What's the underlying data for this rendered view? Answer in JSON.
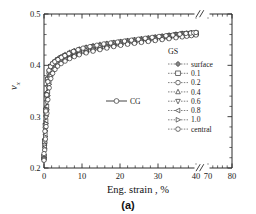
{
  "figure": {
    "caption": "(a)"
  },
  "chart_data": {
    "type": "line",
    "title": "",
    "xlabel": "Eng. strain , %",
    "ylabel": "ν",
    "ylabel_subscript": "x",
    "xlim": [
      0,
      80
    ],
    "ylim": [
      0.2,
      0.5
    ],
    "xticks": [
      0,
      10,
      20,
      30,
      40,
      70,
      80
    ],
    "xticklabels": [
      "0",
      "10",
      "20",
      "30",
      "40",
      "70",
      "80"
    ],
    "yticks": [
      0.2,
      0.3,
      0.4,
      0.5
    ],
    "yticklabels": [
      "0.2",
      "0.3",
      "0.4",
      "0.5"
    ],
    "axis_break": {
      "present": true,
      "between": [
        40,
        70
      ],
      "symbol": "//"
    },
    "grid": false,
    "legend_position": "right-inside",
    "legend_title": "GS",
    "series": [
      {
        "name": "surface",
        "marker": "star",
        "linestyle": "dotted",
        "x": [
          0,
          0.3,
          0.6,
          1.0,
          1.6,
          2.4,
          3.5,
          5,
          7,
          9,
          12,
          15,
          18,
          21,
          24,
          27,
          30,
          33,
          36,
          38,
          40
        ],
        "y": [
          0.225,
          0.275,
          0.325,
          0.375,
          0.398,
          0.405,
          0.412,
          0.419,
          0.426,
          0.431,
          0.437,
          0.441,
          0.444,
          0.447,
          0.45,
          0.453,
          0.456,
          0.459,
          0.462,
          0.463,
          0.464
        ]
      },
      {
        "name": "0.1",
        "marker": "square",
        "linestyle": "dotted",
        "x": [
          0,
          0.3,
          0.6,
          1.0,
          1.6,
          2.4,
          3.5,
          5,
          7,
          9,
          12,
          15,
          18,
          21,
          24,
          27,
          30,
          33,
          36,
          38,
          40
        ],
        "y": [
          0.222,
          0.272,
          0.322,
          0.372,
          0.396,
          0.403,
          0.41,
          0.417,
          0.424,
          0.429,
          0.435,
          0.439,
          0.443,
          0.446,
          0.449,
          0.452,
          0.455,
          0.458,
          0.461,
          0.462,
          0.463
        ]
      },
      {
        "name": "0.2",
        "marker": "circle",
        "linestyle": "dotted",
        "x": [
          0,
          0.3,
          0.6,
          1.0,
          1.6,
          2.4,
          3.5,
          5,
          7,
          9,
          12,
          15,
          18,
          21,
          24,
          27,
          30,
          33,
          36,
          38,
          40
        ],
        "y": [
          0.22,
          0.268,
          0.318,
          0.368,
          0.393,
          0.401,
          0.408,
          0.415,
          0.422,
          0.427,
          0.433,
          0.438,
          0.442,
          0.445,
          0.448,
          0.451,
          0.454,
          0.457,
          0.46,
          0.461,
          0.462
        ]
      },
      {
        "name": "0.4",
        "marker": "triangle-up",
        "linestyle": "dotted",
        "x": [
          0,
          0.3,
          0.6,
          1.0,
          1.6,
          2.4,
          3.5,
          5,
          7,
          9,
          12,
          15,
          18,
          21,
          24,
          27,
          30,
          33,
          36,
          38,
          40
        ],
        "y": [
          0.219,
          0.264,
          0.313,
          0.362,
          0.39,
          0.399,
          0.406,
          0.413,
          0.42,
          0.425,
          0.431,
          0.436,
          0.44,
          0.444,
          0.447,
          0.45,
          0.453,
          0.456,
          0.459,
          0.46,
          0.462
        ]
      },
      {
        "name": "0.6",
        "marker": "triangle-down",
        "linestyle": "dotted",
        "x": [
          0,
          0.3,
          0.6,
          1.0,
          1.6,
          2.4,
          3.5,
          5,
          7,
          9,
          12,
          15,
          18,
          21,
          24,
          27,
          30,
          33,
          36,
          38,
          40
        ],
        "y": [
          0.218,
          0.26,
          0.307,
          0.356,
          0.386,
          0.396,
          0.404,
          0.411,
          0.418,
          0.424,
          0.43,
          0.435,
          0.439,
          0.443,
          0.446,
          0.449,
          0.452,
          0.455,
          0.458,
          0.46,
          0.461
        ]
      },
      {
        "name": "0.8",
        "marker": "triangle-left",
        "linestyle": "dotted",
        "x": [
          0,
          0.3,
          0.6,
          1.0,
          1.6,
          2.4,
          3.5,
          5,
          7,
          9,
          12,
          15,
          18,
          21,
          24,
          27,
          30,
          33,
          36,
          38,
          40
        ],
        "y": [
          0.217,
          0.256,
          0.3,
          0.348,
          0.381,
          0.393,
          0.402,
          0.409,
          0.417,
          0.422,
          0.428,
          0.433,
          0.438,
          0.442,
          0.445,
          0.448,
          0.451,
          0.454,
          0.457,
          0.459,
          0.46
        ]
      },
      {
        "name": "1.0",
        "marker": "triangle-right",
        "linestyle": "dotted",
        "x": [
          0,
          0.3,
          0.6,
          1.0,
          1.6,
          2.4,
          3.5,
          5,
          7,
          9,
          12,
          15,
          18,
          21,
          24,
          27,
          30,
          33,
          36,
          38,
          40
        ],
        "y": [
          0.216,
          0.252,
          0.294,
          0.34,
          0.376,
          0.39,
          0.4,
          0.408,
          0.415,
          0.421,
          0.427,
          0.432,
          0.437,
          0.441,
          0.444,
          0.447,
          0.45,
          0.453,
          0.456,
          0.458,
          0.46
        ]
      },
      {
        "name": "central",
        "marker": "circle",
        "linestyle": "dotted",
        "x": [
          0,
          0.3,
          0.6,
          1.0,
          1.6,
          2.4,
          3.5,
          5,
          7,
          9,
          12,
          15,
          18,
          21,
          24,
          27,
          30,
          33,
          36,
          38,
          40
        ],
        "y": [
          0.215,
          0.248,
          0.288,
          0.332,
          0.37,
          0.387,
          0.398,
          0.406,
          0.414,
          0.42,
          0.426,
          0.431,
          0.436,
          0.44,
          0.443,
          0.446,
          0.449,
          0.452,
          0.455,
          0.457,
          0.459
        ]
      },
      {
        "name": "CG",
        "marker": "circle",
        "linestyle": "solid",
        "x": [
          0,
          0.4,
          0.8,
          1.3,
          2.0,
          3.0,
          4.5,
          6,
          8,
          10,
          13,
          16,
          19,
          22,
          25,
          28,
          31,
          34,
          37,
          39,
          40
        ],
        "y": [
          0.228,
          0.3,
          0.352,
          0.39,
          0.402,
          0.408,
          0.415,
          0.421,
          0.428,
          0.433,
          0.438,
          0.442,
          0.445,
          0.448,
          0.451,
          0.454,
          0.457,
          0.459,
          0.462,
          0.463,
          0.464
        ]
      }
    ],
    "legend_entries": [
      {
        "label": "surface",
        "marker": "star"
      },
      {
        "label": "0.1",
        "marker": "square"
      },
      {
        "label": "0.2",
        "marker": "circle"
      },
      {
        "label": "0.4",
        "marker": "triangle-up"
      },
      {
        "label": "0.6",
        "marker": "triangle-down"
      },
      {
        "label": "0.8",
        "marker": "triangle-left"
      },
      {
        "label": "1.0",
        "marker": "triangle-right"
      },
      {
        "label": "central",
        "marker": "circle"
      }
    ],
    "inline_legend": {
      "label": "CG",
      "marker": "circle",
      "linestyle": "solid"
    }
  }
}
